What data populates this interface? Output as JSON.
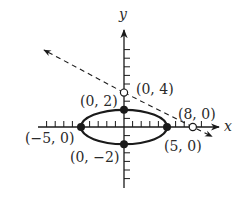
{
  "diagram": {
    "type": "coordinate-plane",
    "axes": {
      "x_label": "x",
      "y_label": "y"
    },
    "ellipse": {
      "center": [
        0,
        0
      ],
      "semi_major": 5,
      "semi_minor": 2
    },
    "dashed_line": {
      "through": [
        [
          0,
          4
        ],
        [
          8,
          0
        ]
      ],
      "arrows": "both"
    },
    "points": [
      {
        "id": "p-0-2",
        "label": "(0, 2)",
        "filled": true
      },
      {
        "id": "p-neg5-0",
        "label": "(−5, 0)",
        "filled": true
      },
      {
        "id": "p-5-0",
        "label": "(5, 0)",
        "filled": true
      },
      {
        "id": "p-0-neg2",
        "label": "(0, −2)",
        "filled": true
      },
      {
        "id": "p-0-4",
        "label": "(0, 4)",
        "filled": false
      },
      {
        "id": "p-8-0",
        "label": "(8, 0)",
        "filled": false
      }
    ],
    "colors": {
      "stroke": "#1a1a1a",
      "text": "#2a2a2a",
      "background": "#ffffff"
    }
  }
}
